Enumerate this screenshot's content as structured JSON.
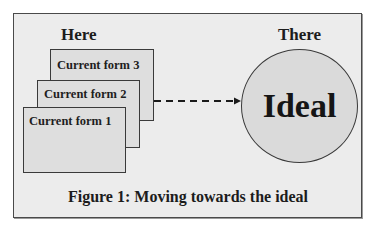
{
  "figure": {
    "caption": "Figure 1: Moving towards the ideal",
    "left_heading": "Here",
    "right_heading": "There",
    "current_forms": [
      {
        "label": "Current form 1"
      },
      {
        "label": "Current form 2"
      },
      {
        "label": "Current form 3"
      }
    ],
    "ideal_label": "Ideal",
    "arrow": {
      "style": "dashed",
      "direction": "right",
      "from": "Current form 2",
      "to": "Ideal",
      "icon": "arrow-right-icon"
    },
    "colors": {
      "background": "#ececec",
      "box_fill": "#dedede",
      "circle_fill": "#dadada",
      "stroke": "#3a3a3a",
      "text": "#1c1c1c"
    }
  }
}
